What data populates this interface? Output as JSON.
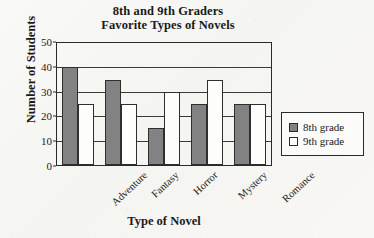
{
  "chart_data": {
    "type": "bar",
    "title": "8th and 9th Graders Favorite Types of Novels",
    "title_line1": "8th and 9th Graders",
    "title_line2": "Favorite Types of Novels",
    "xlabel": "Type of Novel",
    "ylabel": "Number of Students",
    "categories": [
      "Adventure",
      "Fantasy",
      "Horror",
      "Mystery",
      "Romance"
    ],
    "series": [
      {
        "name": "8th grade",
        "values": [
          40,
          35,
          15,
          25,
          25
        ],
        "color": "#828282"
      },
      {
        "name": "9th grade",
        "values": [
          25,
          25,
          30,
          35,
          25
        ],
        "color": "#ffffff"
      }
    ],
    "ylim": [
      0,
      50
    ],
    "yticks": [
      0,
      10,
      20,
      30,
      40,
      50
    ],
    "ytick_labels": [
      "0",
      "10",
      "20",
      "30",
      "40",
      "50"
    ],
    "gridlines": [
      10,
      20,
      30,
      40
    ],
    "grid": true,
    "legend_position": "right-outside"
  },
  "legend": {
    "items": [
      {
        "label": "8th grade",
        "swatch": "filled-gray-square"
      },
      {
        "label": "9th grade",
        "swatch": "open-white-square"
      }
    ]
  }
}
